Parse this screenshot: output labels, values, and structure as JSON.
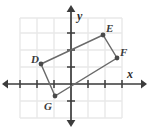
{
  "figure": {
    "name": "coordinate-plane-quadrilateral",
    "background_color": "#ffffff",
    "grid_color": "#e9e9e9",
    "axis_color": "#3c3c3c",
    "shape_color": "#565656",
    "label_color": "#3a3a3a"
  },
  "axes": {
    "x_label": "x",
    "y_label": "y",
    "origin_px": {
      "x": 71,
      "y": 84
    },
    "unit_px": 17,
    "x_axis_y_px": 84,
    "y_axis_x_px": 71,
    "x_tick_positions_px": [
      20,
      37,
      54,
      88,
      105,
      122
    ],
    "y_tick_positions_px": [
      33,
      50,
      67,
      101
    ],
    "x_arrow_left_px": 6,
    "x_arrow_right_px": 143,
    "y_arrow_top_px": 8,
    "y_arrow_bottom_px": 124
  },
  "grid": {
    "left_px": 20,
    "right_px": 122,
    "top_px": 18,
    "bottom_px": 118,
    "cell_px": 17,
    "vertical_lines_px": [
      20,
      37,
      54,
      71,
      88,
      105,
      122
    ],
    "horizontal_lines_px": [
      18,
      33,
      50,
      67,
      84,
      101,
      118
    ]
  },
  "chart_data": {
    "type": "scatter",
    "title": "",
    "xlabel": "x",
    "ylabel": "y",
    "grid": true,
    "legend": null,
    "xlim": [
      -3,
      3
    ],
    "ylim": [
      -3,
      3
    ],
    "points": [
      {
        "label": "D",
        "x": -1.8,
        "y": 1.2,
        "px": 41,
        "py": 64,
        "label_px": 31,
        "label_py": 63
      },
      {
        "label": "E",
        "x": 1.9,
        "y": 2.9,
        "px": 103,
        "py": 35,
        "label_px": 106,
        "label_py": 32
      },
      {
        "label": "F",
        "x": 2.7,
        "y": 1.5,
        "px": 117,
        "py": 58,
        "label_px": 120,
        "label_py": 56
      },
      {
        "label": "G",
        "x": -0.9,
        "y": -0.7,
        "px": 55,
        "py": 96,
        "label_px": 44,
        "label_py": 110
      }
    ],
    "polygon_order": [
      "D",
      "E",
      "F",
      "G"
    ],
    "polygon_closed": true
  }
}
